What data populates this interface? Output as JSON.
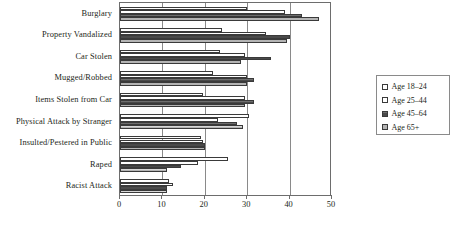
{
  "chart_data": {
    "type": "bar",
    "orientation": "horizontal",
    "title": "",
    "xlabel": "",
    "ylabel": "",
    "xlim": [
      0,
      50
    ],
    "xticks": [
      0,
      10,
      20,
      30,
      40,
      50
    ],
    "grid": true,
    "legend_position": "right",
    "categories": [
      "Burglary",
      "Property Vandalized",
      "Car Stolen",
      "Mugged/Robbed",
      "Items Stolen from Car",
      "Physical Attack by Stranger",
      "Insulted/Pestered in Public",
      "Raped",
      "Racist Attack"
    ],
    "series": [
      {
        "name": "Age 18–24",
        "swatch": "white",
        "color": "#ffffff",
        "values": [
          30.0,
          24.0,
          23.5,
          22.0,
          19.5,
          30.5,
          19.0,
          25.5,
          11.5
        ]
      },
      {
        "name": "Age 25–44",
        "swatch": "white",
        "color": "#ffffff",
        "values": [
          39.0,
          34.5,
          29.5,
          30.0,
          29.5,
          23.0,
          19.5,
          18.5,
          12.5
        ]
      },
      {
        "name": "Age 45–64",
        "swatch": "dark-gray",
        "color": "#5e5e5e",
        "values": [
          43.0,
          40.0,
          35.5,
          31.5,
          31.5,
          27.5,
          20.0,
          14.5,
          11.0
        ]
      },
      {
        "name": "Age 65+",
        "swatch": "light-gray",
        "color": "#c8c8c8",
        "values": [
          47.0,
          39.5,
          28.5,
          30.0,
          29.5,
          29.0,
          20.0,
          11.0,
          11.0
        ]
      }
    ]
  },
  "legend": {
    "items": [
      {
        "label": "Age 18–24"
      },
      {
        "label": "Age 25–44"
      },
      {
        "label": "Age 45–64"
      },
      {
        "label": "Age 65+"
      }
    ]
  }
}
